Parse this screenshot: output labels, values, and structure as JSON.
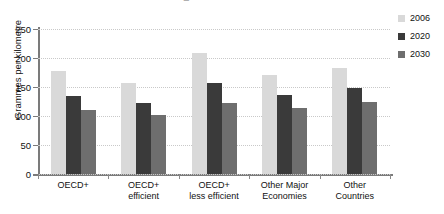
{
  "chart_data": {
    "type": "bar",
    "title": "",
    "xlabel": "",
    "ylabel": "Grammes per kilometre",
    "ylim": [
      0,
      250
    ],
    "yticks": [
      "0",
      "50",
      "100",
      "150",
      "200",
      "250"
    ],
    "grid": true,
    "legend_position": "right",
    "categories": [
      "OECD+",
      "OECD+\nefficient",
      "OECD+\nless efficient",
      "Other Major\nEconomies",
      "Other\nCountries"
    ],
    "series": [
      {
        "name": "2006",
        "color": "#d9d9d9",
        "values": [
          177,
          157,
          208,
          170,
          183
        ]
      },
      {
        "name": "2020",
        "color": "#3a3a3a",
        "values": [
          135,
          122,
          157,
          136,
          148
        ]
      },
      {
        "name": "2030",
        "color": "#6e6e6e",
        "values": [
          111,
          101,
          123,
          114,
          124
        ]
      }
    ]
  },
  "axis": {
    "y_title": "Grammes per kilometre",
    "y_ticks": [
      "250",
      "200",
      "150",
      "100",
      "50",
      "0"
    ]
  },
  "categories": [
    {
      "line1": "OECD+",
      "line2": ""
    },
    {
      "line1": "OECD+",
      "line2": "efficient"
    },
    {
      "line1": "OECD+",
      "line2": "less efficient"
    },
    {
      "line1": "Other Major",
      "line2": "Economies"
    },
    {
      "line1": "Other",
      "line2": "Countries"
    }
  ],
  "legend": {
    "items": [
      {
        "label": "2006",
        "color": "#d9d9d9"
      },
      {
        "label": "2020",
        "color": "#3a3a3a"
      },
      {
        "label": "2030",
        "color": "#6e6e6e"
      }
    ]
  },
  "title_remnant": {
    "text": "■"
  }
}
